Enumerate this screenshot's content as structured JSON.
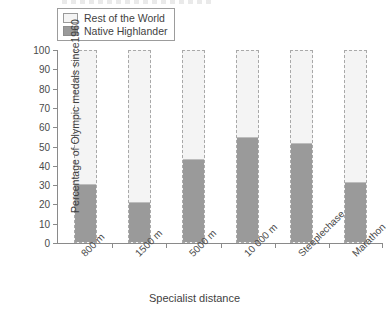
{
  "chart_data": {
    "type": "bar",
    "subtype": "stacked-bar",
    "title": "",
    "xlabel": "Specialist distance",
    "ylabel": "Percentage of Olympic medals since 1960",
    "ylabel_lines": [
      "Percentage of Olympic medals since",
      "1960"
    ],
    "categories": [
      "800 m",
      "1500 m",
      "5000 m",
      "10 000 m",
      "Steeplechase",
      "Marathon"
    ],
    "series": [
      {
        "name": "Native Highlander",
        "color": "#9a9a9a",
        "values": [
          30,
          20.5,
          43,
          54.5,
          51.5,
          31
        ]
      },
      {
        "name": "Rest of the World",
        "color": "#f4f4f4",
        "values": [
          70,
          79.5,
          57,
          45.5,
          48.5,
          69
        ]
      }
    ],
    "ylim": [
      0,
      100
    ],
    "yticks": [
      0,
      10,
      20,
      30,
      40,
      50,
      60,
      70,
      80,
      90,
      100
    ],
    "ytick_labels": [
      "0",
      "10",
      "20",
      "30",
      "40",
      "50",
      "60",
      "70",
      "80",
      "90",
      "100"
    ],
    "grid": false,
    "legend_position": "top-left",
    "stack_total": 100
  },
  "legend": {
    "items": [
      {
        "label": "Rest of the World",
        "swatch": "rest"
      },
      {
        "label": "Native Highlander",
        "swatch": "native"
      }
    ]
  },
  "colors": {
    "native_highlander": "#9a9a9a",
    "rest_of_world": "#f4f4f4",
    "axis": "#8a8a8a",
    "text": "#4a4a4a",
    "bar_border": "#a9a9a9"
  }
}
